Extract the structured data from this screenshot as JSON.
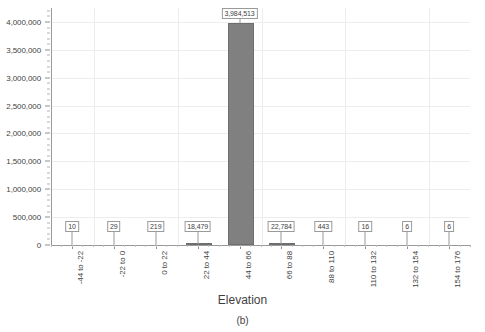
{
  "chart_data": {
    "type": "bar",
    "title": "",
    "subtitle": "",
    "xlabel": "Elevation",
    "ylabel": "",
    "categories": [
      "-44 to -22",
      "-22 to 0",
      "0 to 22",
      "22 to 44",
      "44 to 66",
      "66 to 88",
      "88 to 110",
      "110 to 132",
      "132 to 154",
      "154 to 176"
    ],
    "values": [
      10,
      29,
      219,
      18479,
      3984513,
      22784,
      443,
      16,
      6,
      6
    ],
    "data_labels": [
      "10",
      "29",
      "219",
      "18,479",
      "3,984,513",
      "22,784",
      "443",
      "16",
      "6",
      "6"
    ],
    "ylim": [
      0,
      4250000
    ],
    "ytick_values": [
      0,
      500000,
      1000000,
      1500000,
      2000000,
      2500000,
      3000000,
      3500000,
      4000000
    ],
    "ytick_labels": [
      "0",
      "500,000",
      "1,000,000",
      "1,500,000",
      "2,000,000",
      "2,500,000",
      "3,000,000",
      "3,500,000",
      "4,000,000"
    ],
    "grid": true,
    "legend": null,
    "legend_position": "none",
    "bar_color": "#808080",
    "grid_color": "#ededed",
    "axis_color": "#9a9a9a"
  },
  "caption": "(b)"
}
